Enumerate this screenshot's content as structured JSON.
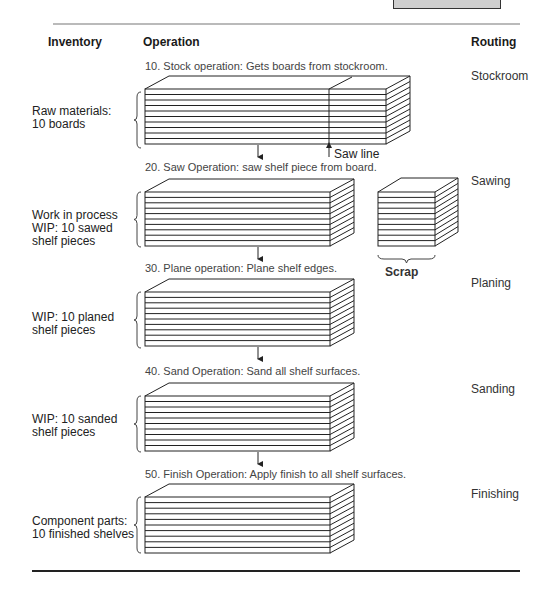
{
  "header": {
    "inventory": "Inventory",
    "operation": "Operation",
    "routing": "Routing"
  },
  "steps": [
    {
      "operation": "10. Stock operation: Gets boards from stockroom.",
      "routing": "Stockroom",
      "inventory": "Raw materials:\n10 boards"
    },
    {
      "operation": "20. Saw Operation: saw shelf piece from board.",
      "routing": "Sawing",
      "inventory": "Work in process\nWIP: 10 sawed\nshelf pieces"
    },
    {
      "operation": "30. Plane operation: Plane shelf edges.",
      "routing": "Planing",
      "inventory": "WIP: 10 planed\nshelf pieces"
    },
    {
      "operation": "40. Sand Operation: Sand all shelf surfaces.",
      "routing": "Sanding",
      "inventory": "WIP: 10 sanded\nshelf pieces"
    },
    {
      "operation": "50. Finish Operation: Apply finish to all shelf surfaces.",
      "routing": "Finishing",
      "inventory": "Component parts:\n10 finished shelves"
    }
  ],
  "annotations": {
    "saw_line": "Saw line",
    "scrap": "Scrap"
  },
  "board_count": 10
}
